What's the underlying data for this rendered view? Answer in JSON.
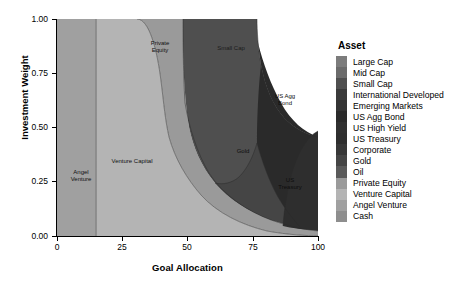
{
  "chart_data": {
    "type": "area",
    "title": "",
    "xlabel": "Goal Allocation",
    "ylabel": "Investment Weight",
    "xlim": [
      0,
      100
    ],
    "ylim": [
      0.0,
      1.0
    ],
    "xticks": [
      "0",
      "25",
      "50",
      "75",
      "100"
    ],
    "yticks": [
      "0.00",
      "0.25",
      "0.50",
      "0.75",
      "1.00"
    ],
    "grid": false,
    "legend_position": "right",
    "legend_title": "Asset",
    "x": [
      0,
      10,
      15,
      20,
      25,
      30,
      35,
      40,
      45,
      50,
      55,
      60,
      65,
      70,
      75,
      80,
      85,
      90,
      95,
      100
    ],
    "series": [
      {
        "name": "Large Cap",
        "color": "#7c7c7c",
        "values": [
          0,
          0,
          0,
          0,
          0,
          0,
          0,
          0,
          0,
          0,
          0,
          0,
          0,
          0,
          0,
          0,
          0,
          0,
          0,
          0
        ]
      },
      {
        "name": "Mid Cap",
        "color": "#6b6b6b",
        "values": [
          0,
          0,
          0,
          0,
          0,
          0,
          0,
          0,
          0,
          0,
          0,
          0,
          0,
          0,
          0,
          0,
          0,
          0,
          0,
          0
        ]
      },
      {
        "name": "Small Cap",
        "color": "#4f4f4f",
        "values": [
          0,
          0,
          0,
          0,
          0,
          0,
          0,
          0.02,
          0.1,
          0.22,
          0.36,
          0.44,
          0.47,
          0.46,
          0.42,
          0.34,
          0.26,
          0.2,
          0.15,
          0.12
        ]
      },
      {
        "name": "International Developed",
        "color": "#3a3a3a",
        "values": [
          0,
          0,
          0,
          0,
          0,
          0,
          0,
          0,
          0,
          0,
          0,
          0,
          0,
          0,
          0,
          0,
          0,
          0,
          0,
          0
        ]
      },
      {
        "name": "Emerging Markets",
        "color": "#343434",
        "values": [
          0,
          0,
          0,
          0,
          0,
          0,
          0,
          0,
          0,
          0,
          0,
          0,
          0,
          0,
          0,
          0,
          0,
          0,
          0,
          0
        ]
      },
      {
        "name": "US Agg Bond",
        "color": "#2a2a2a",
        "values": [
          0,
          0,
          0,
          0,
          0,
          0,
          0,
          0,
          0,
          0,
          0,
          0,
          0.01,
          0.04,
          0.12,
          0.22,
          0.3,
          0.34,
          0.36,
          0.37
        ]
      },
      {
        "name": "US High Yield",
        "color": "#303030",
        "values": [
          0,
          0,
          0,
          0,
          0,
          0,
          0,
          0,
          0,
          0,
          0,
          0,
          0,
          0,
          0,
          0,
          0,
          0,
          0,
          0
        ]
      },
      {
        "name": "US Treasury",
        "color": "#2e2e2e",
        "values": [
          0,
          0,
          0,
          0,
          0,
          0,
          0,
          0,
          0,
          0,
          0,
          0,
          0,
          0.01,
          0.03,
          0.1,
          0.18,
          0.24,
          0.28,
          0.3
        ]
      },
      {
        "name": "Corporate",
        "color": "#373737",
        "values": [
          0,
          0,
          0,
          0,
          0,
          0,
          0,
          0,
          0,
          0,
          0,
          0,
          0,
          0,
          0,
          0,
          0,
          0,
          0,
          0
        ]
      },
      {
        "name": "Gold",
        "color": "#454545",
        "values": [
          0,
          0,
          0,
          0,
          0,
          0,
          0,
          0,
          0,
          0.01,
          0.03,
          0.06,
          0.09,
          0.12,
          0.13,
          0.11,
          0.08,
          0.06,
          0.05,
          0.04
        ]
      },
      {
        "name": "Oil",
        "color": "#5a5a5a",
        "values": [
          0,
          0,
          0,
          0,
          0,
          0,
          0,
          0,
          0,
          0,
          0,
          0,
          0,
          0,
          0,
          0,
          0,
          0,
          0,
          0
        ]
      },
      {
        "name": "Private Equity",
        "color": "#9a9a9a",
        "values": [
          0,
          0,
          0,
          0,
          0,
          0.02,
          0.12,
          0.24,
          0.34,
          0.43,
          0.44,
          0.38,
          0.3,
          0.23,
          0.17,
          0.12,
          0.08,
          0.05,
          0.03,
          0.02
        ]
      },
      {
        "name": "Venture Capital",
        "color": "#b4b4b4",
        "values": [
          0,
          0,
          0,
          1.0,
          1.0,
          0.98,
          0.88,
          0.74,
          0.56,
          0.34,
          0.17,
          0.12,
          0.13,
          0.14,
          0.13,
          0.11,
          0.1,
          0.11,
          0.13,
          0.15
        ]
      },
      {
        "name": "Angel Venture",
        "color": "#a0a0a0",
        "values": [
          1.0,
          1.0,
          1.0,
          0,
          0,
          0,
          0,
          0,
          0,
          0,
          0,
          0,
          0,
          0,
          0,
          0,
          0,
          0,
          0,
          0
        ]
      },
      {
        "name": "Cash",
        "color": "#8e8e8e",
        "values": [
          0,
          0,
          0,
          0,
          0,
          0,
          0,
          0,
          0,
          0,
          0,
          0,
          0,
          0,
          0,
          0,
          0,
          0,
          0,
          0
        ]
      }
    ],
    "region_labels": [
      {
        "text": "Angel\nVenture",
        "x": 7,
        "y": 0.27
      },
      {
        "text": "Venture Capital",
        "x": 39,
        "y": 0.34
      },
      {
        "text": "Private\nEquity",
        "x": 42,
        "y": 0.87
      },
      {
        "text": "Small Cap",
        "x": 68,
        "y": 0.86
      },
      {
        "text": "US Agg\nBond",
        "x": 88,
        "y": 0.58
      },
      {
        "text": "Gold",
        "x": 74,
        "y": 0.34
      },
      {
        "text": "US\nTreasury",
        "x": 90,
        "y": 0.22
      }
    ]
  },
  "legend": {
    "title": "Asset",
    "items": [
      {
        "label": "Large Cap",
        "color": "#7c7c7c"
      },
      {
        "label": "Mid Cap",
        "color": "#6b6b6b"
      },
      {
        "label": "Small Cap",
        "color": "#4f4f4f"
      },
      {
        "label": "International Developed",
        "color": "#3a3a3a"
      },
      {
        "label": "Emerging Markets",
        "color": "#343434"
      },
      {
        "label": "US Agg Bond",
        "color": "#2a2a2a"
      },
      {
        "label": "US High Yield",
        "color": "#303030"
      },
      {
        "label": "US Treasury",
        "color": "#2e2e2e"
      },
      {
        "label": "Corporate",
        "color": "#373737"
      },
      {
        "label": "Gold",
        "color": "#454545"
      },
      {
        "label": "Oil",
        "color": "#5a5a5a"
      },
      {
        "label": "Private Equity",
        "color": "#9a9a9a"
      },
      {
        "label": "Venture Capital",
        "color": "#b4b4b4"
      },
      {
        "label": "Angel Venture",
        "color": "#a0a0a0"
      },
      {
        "label": "Cash",
        "color": "#8e8e8e"
      }
    ]
  },
  "axes": {
    "x_title": "Goal Allocation",
    "y_title": "Investment Weight",
    "x_ticks": [
      "0",
      "25",
      "50",
      "75",
      "100"
    ],
    "y_ticks": [
      "0.00",
      "0.25",
      "0.50",
      "0.75",
      "1.00"
    ]
  },
  "region_text": {
    "angel_venture": "Angel\nVenture",
    "venture_capital": "Venture Capital",
    "private_equity": "Private\nEquity",
    "small_cap": "Small Cap",
    "us_agg_bond": "US Agg\nBond",
    "gold": "Gold",
    "us_treasury": "US\nTreasury"
  }
}
